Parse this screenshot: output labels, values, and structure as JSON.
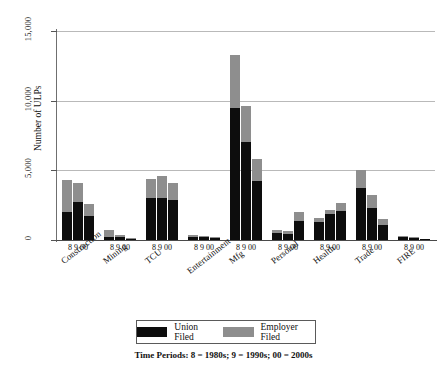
{
  "chart_data": {
    "type": "bar",
    "title": "",
    "subtitle": "",
    "xlabel": "",
    "ylabel": "Number of ULPs",
    "ylim": [
      0,
      15000
    ],
    "yticks": [
      "0",
      "5,000",
      "10,000",
      "15,000"
    ],
    "ytick_values": [
      0,
      5000,
      10000,
      15000
    ],
    "grid": true,
    "stacked": true,
    "legend_position": "bottom",
    "caption": "Time Periods: 8 = 1980s;  9 = 1990s;  00 = 2000s",
    "period_labels": [
      "8",
      "9",
      "00"
    ],
    "categories": [
      "Construction",
      "Mining",
      "TCU",
      "Entertainment",
      "Mfg",
      "Personal",
      "Health",
      "Trade",
      "FIRE"
    ],
    "series": [
      {
        "name": "Union Filed",
        "color": "#0d0d0d",
        "values_by_category": {
          "Construction": [
            2000,
            2700,
            1700
          ],
          "Mining": [
            250,
            220,
            90
          ],
          "TCU": [
            3000,
            3000,
            2850
          ],
          "Entertainment": [
            230,
            230,
            160
          ],
          "Mfg": [
            9500,
            7000,
            4200
          ],
          "Personal": [
            480,
            450,
            1400
          ],
          "Health": [
            1300,
            1900,
            2050
          ],
          "Trade": [
            3750,
            2300,
            1100
          ],
          "FIRE": [
            200,
            150,
            60
          ]
        }
      },
      {
        "name": "Employer Filed",
        "color": "#8e8e8e",
        "values_by_category": {
          "Construction": [
            2300,
            1400,
            900
          ],
          "Mining": [
            450,
            130,
            60
          ],
          "TCU": [
            1350,
            1600,
            1250
          ],
          "Entertainment": [
            120,
            90,
            70
          ],
          "Mfg": [
            3800,
            2600,
            1600
          ],
          "Personal": [
            220,
            200,
            600
          ],
          "Health": [
            250,
            250,
            600
          ],
          "Trade": [
            1250,
            950,
            400
          ],
          "FIRE": [
            80,
            60,
            40
          ]
        }
      }
    ],
    "totals_by_category": {
      "Construction": [
        4300,
        4100,
        2600
      ],
      "Mining": [
        700,
        350,
        150
      ],
      "TCU": [
        4350,
        4600,
        4100
      ],
      "Entertainment": [
        350,
        320,
        230
      ],
      "Mfg": [
        13300,
        9600,
        5800
      ],
      "Personal": [
        700,
        650,
        2000
      ],
      "Health": [
        1550,
        2150,
        2650
      ],
      "Trade": [
        5000,
        3250,
        1500
      ],
      "FIRE": [
        280,
        210,
        100
      ]
    }
  },
  "legend": {
    "items": [
      {
        "label": "Union Filed",
        "swatch": "union-filed-swatch"
      },
      {
        "label": "Employer Filed",
        "swatch": "employer-filed-swatch"
      }
    ]
  }
}
